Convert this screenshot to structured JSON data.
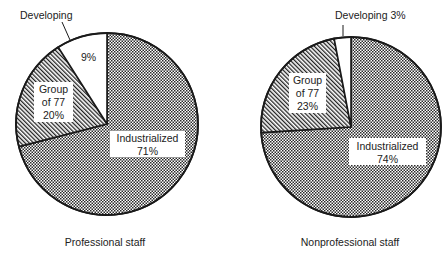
{
  "chart_data": [
    {
      "type": "pie",
      "title": "Professional staff",
      "slices": [
        {
          "label": "Industrialized",
          "value": 71,
          "display": "71%",
          "pattern": "dots"
        },
        {
          "label": "Group of 77",
          "value": 20,
          "display": "20%",
          "pattern": "hatch"
        },
        {
          "label": "Developing",
          "value": 9,
          "display": "9%",
          "pattern": "white"
        }
      ],
      "start_angle_deg": 0,
      "direction": "clockwise"
    },
    {
      "type": "pie",
      "title": "Nonprofessional staff",
      "slices": [
        {
          "label": "Industrialized",
          "value": 74,
          "display": "74%",
          "pattern": "dots"
        },
        {
          "label": "Group of 77",
          "value": 23,
          "display": "23%",
          "pattern": "hatch"
        },
        {
          "label": "Developing",
          "value": 3,
          "display": "3%",
          "pattern": "white"
        }
      ],
      "start_angle_deg": 0,
      "direction": "clockwise"
    }
  ],
  "labels": {
    "left": {
      "developing_callout": "Developing",
      "developing_value": "9%",
      "group77_line1": "Group",
      "group77_line2": "of 77",
      "group77_value": "20%",
      "industrialized_line1": "Industrialized",
      "industrialized_value": "71%",
      "caption": "Professional staff"
    },
    "right": {
      "developing_callout": "Developing 3%",
      "group77_line1": "Group",
      "group77_line2": "of 77",
      "group77_value": "23%",
      "industrialized_line1": "Industrialized",
      "industrialized_value": "74%",
      "caption": "Nonprofessional staff"
    }
  },
  "colors": {
    "outline": "#1a1a1a",
    "dots": "#2a2a2a",
    "background": "#ffffff"
  }
}
